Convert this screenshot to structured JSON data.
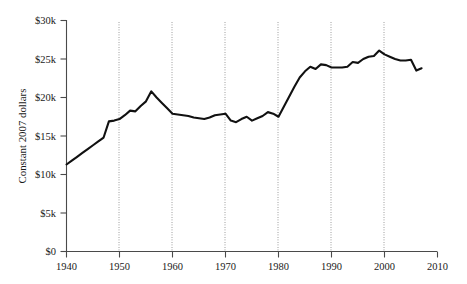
{
  "chart_data": {
    "type": "line",
    "title": "",
    "subtitle": "",
    "xlabel": "",
    "ylabel": "Constant 2007 dollars",
    "xlim": [
      1940,
      2010
    ],
    "ylim": [
      0,
      30000
    ],
    "grid": "vertical-dotted-at-decades",
    "legend": "none",
    "x_ticks": [
      1940,
      1950,
      1960,
      1970,
      1980,
      1990,
      2000,
      2010
    ],
    "x_tick_labels": [
      "1940",
      "1950",
      "1960",
      "1970",
      "1980",
      "1990",
      "2000",
      "2010"
    ],
    "y_ticks": [
      0,
      5000,
      10000,
      15000,
      20000,
      25000,
      30000
    ],
    "y_tick_labels": [
      "$0",
      "$5k",
      "$10k",
      "$15k",
      "$20k",
      "$25k",
      "$30k"
    ],
    "series": [
      {
        "name": "Constant 2007 dollars",
        "x": [
          1940,
          1941,
          1942,
          1943,
          1944,
          1945,
          1946,
          1947,
          1948,
          1949,
          1950,
          1951,
          1952,
          1953,
          1954,
          1955,
          1956,
          1957,
          1958,
          1959,
          1960,
          1961,
          1962,
          1963,
          1964,
          1965,
          1966,
          1967,
          1968,
          1969,
          1970,
          1971,
          1972,
          1973,
          1974,
          1975,
          1976,
          1977,
          1978,
          1979,
          1980,
          1981,
          1982,
          1983,
          1984,
          1985,
          1986,
          1987,
          1988,
          1989,
          1990,
          1991,
          1992,
          1993,
          1994,
          1995,
          1996,
          1997,
          1998,
          1999,
          2000,
          2001,
          2002,
          2003,
          2004,
          2005,
          2006,
          2007
        ],
        "y": [
          11300,
          11800,
          12300,
          12800,
          13300,
          13800,
          14300,
          14800,
          16900,
          17000,
          17200,
          17700,
          18300,
          18200,
          18900,
          19500,
          20800,
          20000,
          19300,
          18600,
          17900,
          17800,
          17700,
          17600,
          17400,
          17300,
          17200,
          17400,
          17700,
          17800,
          17900,
          17000,
          16800,
          17200,
          17500,
          17000,
          17300,
          17600,
          18100,
          17900,
          17500,
          18800,
          20100,
          21400,
          22600,
          23400,
          24000,
          23700,
          24300,
          24200,
          23900,
          23900,
          23900,
          24000,
          24600,
          24500,
          25000,
          25300,
          25400,
          26100,
          25600,
          25300,
          25000,
          24800,
          24800,
          24900,
          23500,
          23800
        ]
      }
    ]
  },
  "axes": {
    "y_axis_title": "Constant 2007 dollars"
  }
}
